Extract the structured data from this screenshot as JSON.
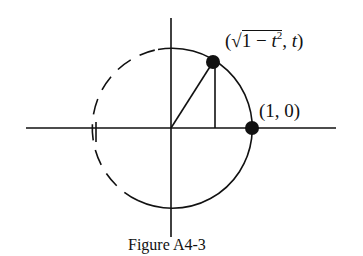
{
  "figure": {
    "caption": "Figure A4-3",
    "labels": {
      "upper_point": {
        "open": "(",
        "radical": "√",
        "one": "1",
        "minus": " − ",
        "t": "t",
        "exp": "2",
        "sep": ", ",
        "t2": "t",
        "close": ")",
        "full_text": "(√(1 − t²), t)"
      },
      "right_point": "(1, 0)"
    },
    "geometry": {
      "center": [
        172,
        128
      ],
      "radius": 80,
      "upper_point": [
        213,
        62
      ],
      "right_point": [
        252,
        128
      ],
      "solid_arc": "right half of circle (from top-left of vertical axis, clockwise to bottom-left)",
      "dashed_arc": "left portion of circle"
    },
    "colors": {
      "ink": "#111111",
      "background": "#ffffff"
    }
  }
}
